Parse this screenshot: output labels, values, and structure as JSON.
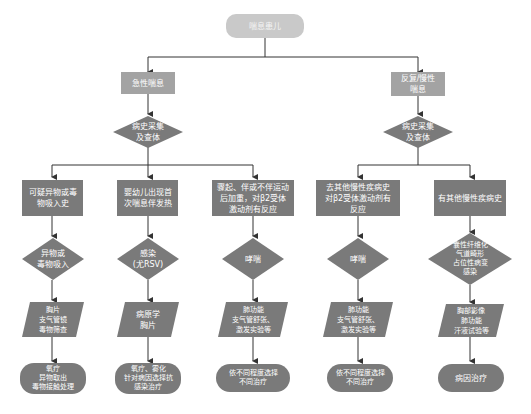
{
  "diagram": {
    "root": "喘息患儿",
    "branches": [
      {
        "category": "急性喘息",
        "assessment": "病史采集\n及查体",
        "paths": [
          {
            "history": "可疑异物或毒\n物吸入史",
            "diagnosis": "异物或\n毒物吸入",
            "tests": "胸片\n支气管镜\n毒物筛查",
            "treatment": "氧疗\n异物取出\n毒物接触处理"
          },
          {
            "history": "婴幼儿出现首\n次喘息伴发热",
            "diagnosis": "感染\n(尤RSV)",
            "tests": "病原学\n胸片",
            "treatment": "氧疗、雾化\n针对病因选择抗\n感染治疗"
          },
          {
            "history": "骤起、伴或不伴运动\n后加重，对β2受体\n激动剂有反应",
            "diagnosis": "哮喘",
            "tests": "肺功能\n支气管舒张、\n激发实验等",
            "treatment": "依不同程度选择\n不同治疗"
          }
        ]
      },
      {
        "category": "反复/慢性\n喘息",
        "assessment": "病史采集\n及查体",
        "paths": [
          {
            "history": "去其他慢性疾病史\n对β2受体激动剂有\n反应",
            "diagnosis": "哮喘",
            "tests": "肺功能\n支气管舒张、\n激发实验等",
            "treatment": "依不同程度选择\n不同治疗"
          },
          {
            "history": "有其他慢性疾病史",
            "diagnosis": "囊性纤维化\n气道畸形\n占位性病变\n感染",
            "tests": "胸部影像\n肺功能\n汗液试验等",
            "treatment": "病因治疗"
          }
        ]
      }
    ]
  },
  "colors": {
    "node_fill": "#7a7a7a",
    "category_fill": "#a3a3a3",
    "root_fill": "#c9c9c9",
    "line": "#333333"
  }
}
